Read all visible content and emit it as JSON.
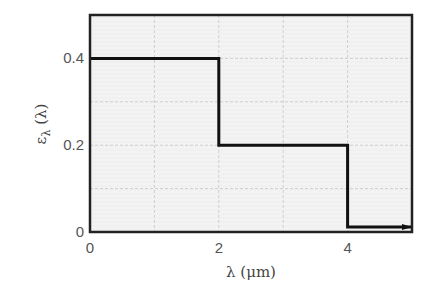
{
  "chart_data": {
    "type": "line",
    "title": "",
    "xlabel": "λ (μm)",
    "ylabel": "ελ (λ)",
    "xlim": [
      0,
      5
    ],
    "ylim": [
      0,
      0.5
    ],
    "grid": true,
    "x_ticks": [
      "0",
      "2",
      "4"
    ],
    "y_ticks": [
      "0",
      "0.2",
      "0.4"
    ],
    "x_tick_values": [
      0,
      2,
      4
    ],
    "y_tick_values": [
      0,
      0.2,
      0.4
    ],
    "series": [
      {
        "name": "spectral emissivity",
        "style": "step",
        "points": [
          [
            0,
            0.4
          ],
          [
            2,
            0.4
          ],
          [
            2,
            0.2
          ],
          [
            4,
            0.2
          ],
          [
            4,
            0.0
          ],
          [
            5,
            0.0
          ]
        ],
        "segments": [
          {
            "x_start": 0,
            "x_end": 2,
            "value": 0.4
          },
          {
            "x_start": 2,
            "x_end": 4,
            "value": 0.2
          },
          {
            "x_start": 4,
            "x_end": 5,
            "value": 0.0
          }
        ],
        "arrow_at_end": true
      }
    ]
  },
  "labels": {
    "xlabel": "λ (μm)",
    "ylabel_main": "ε",
    "ylabel_sub": "λ",
    "ylabel_arg": " (λ)"
  }
}
